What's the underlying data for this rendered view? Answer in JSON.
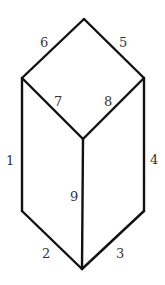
{
  "diagram": {
    "stroke_color": "#111111",
    "label_color": "#333333",
    "vertices": {
      "top": [
        84,
        19
      ],
      "left_upper": [
        22,
        78
      ],
      "right_upper": [
        144,
        78
      ],
      "center": [
        83,
        139
      ],
      "left_lower": [
        22,
        211
      ],
      "right_lower": [
        144,
        211
      ],
      "bottom": [
        82,
        269
      ]
    },
    "edges": [
      {
        "label": "1",
        "from": "left_upper",
        "to": "left_lower",
        "label_pos": [
          8,
          165
        ]
      },
      {
        "label": "2",
        "from": "left_lower",
        "to": "bottom",
        "label_pos": [
          42,
          257
        ]
      },
      {
        "label": "3",
        "from": "bottom",
        "to": "right_lower",
        "label_pos": [
          116,
          257
        ]
      },
      {
        "label": "4",
        "from": "right_lower",
        "to": "right_upper",
        "label_pos": [
          151,
          163
        ]
      },
      {
        "label": "5",
        "from": "right_upper",
        "to": "top",
        "label_pos": [
          119,
          47
        ]
      },
      {
        "label": "6",
        "from": "top",
        "to": "left_upper",
        "label_pos": [
          41,
          47
        ]
      },
      {
        "label": "7",
        "from": "left_upper",
        "to": "center",
        "label_pos": [
          54,
          105
        ]
      },
      {
        "label": "8",
        "from": "center",
        "to": "right_upper",
        "label_pos": [
          104,
          105
        ]
      },
      {
        "label": "9",
        "from": "center",
        "to": "bottom",
        "label_pos": [
          71,
          200
        ]
      }
    ]
  }
}
